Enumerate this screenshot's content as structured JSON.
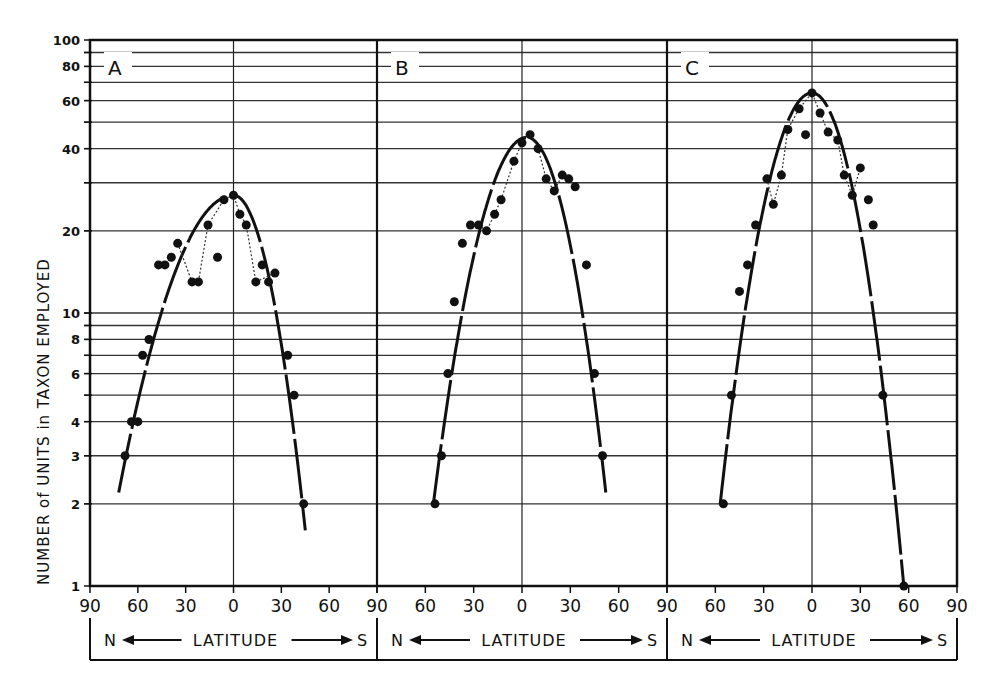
{
  "chart_data": {
    "type": "scatter",
    "ylabel": "NUMBER of UNITS in TAXON EMPLOYED",
    "xlabel": "LATITUDE",
    "xlabel_left": "N",
    "xlabel_right": "S",
    "yscale": "log",
    "ylim": [
      1,
      100
    ],
    "yticks": [
      1,
      2,
      3,
      4,
      6,
      8,
      10,
      20,
      40,
      60,
      80,
      100
    ],
    "ygrid": [
      2,
      3,
      4,
      5,
      6,
      7,
      8,
      9,
      10,
      20,
      30,
      40,
      50,
      60,
      70,
      80,
      90
    ],
    "xticks": [
      "90",
      "60",
      "30",
      "0",
      "30",
      "60",
      "90"
    ],
    "x_note": "Negative x = North latitude, positive x = South latitude",
    "panels": [
      {
        "label": "A",
        "points": [
          {
            "x": -68,
            "y": 3
          },
          {
            "x": -64,
            "y": 4
          },
          {
            "x": -60,
            "y": 4
          },
          {
            "x": -57,
            "y": 7
          },
          {
            "x": -53,
            "y": 8
          },
          {
            "x": -47,
            "y": 15
          },
          {
            "x": -43,
            "y": 15
          },
          {
            "x": -39,
            "y": 16
          },
          {
            "x": -35,
            "y": 18
          },
          {
            "x": -26,
            "y": 13
          },
          {
            "x": -22,
            "y": 13
          },
          {
            "x": -16,
            "y": 21
          },
          {
            "x": -10,
            "y": 16
          },
          {
            "x": -6,
            "y": 26
          },
          {
            "x": 0,
            "y": 27
          },
          {
            "x": 4,
            "y": 23
          },
          {
            "x": 8,
            "y": 21
          },
          {
            "x": 14,
            "y": 13
          },
          {
            "x": 18,
            "y": 15
          },
          {
            "x": 22,
            "y": 13
          },
          {
            "x": 26,
            "y": 14
          },
          {
            "x": 34,
            "y": 7
          },
          {
            "x": 38,
            "y": 5
          },
          {
            "x": 44,
            "y": 2
          }
        ],
        "dotted_path": [
          [
            -35,
            18
          ],
          [
            -26,
            13
          ],
          [
            -22,
            13
          ],
          [
            -16,
            21
          ],
          [
            -6,
            26
          ],
          [
            0,
            27
          ],
          [
            4,
            23
          ],
          [
            8,
            21
          ],
          [
            14,
            13
          ],
          [
            26,
            14
          ]
        ],
        "fit_curve": {
          "peak_x": 0,
          "peak_y": 27,
          "left_end": [
            -72,
            2.2
          ],
          "right_end": [
            45,
            1.6
          ]
        }
      },
      {
        "label": "B",
        "points": [
          {
            "x": -54,
            "y": 2
          },
          {
            "x": -50,
            "y": 3
          },
          {
            "x": -46,
            "y": 6
          },
          {
            "x": -42,
            "y": 11
          },
          {
            "x": -37,
            "y": 18
          },
          {
            "x": -32,
            "y": 21
          },
          {
            "x": -27,
            "y": 21
          },
          {
            "x": -22,
            "y": 20
          },
          {
            "x": -17,
            "y": 23
          },
          {
            "x": -13,
            "y": 26
          },
          {
            "x": -5,
            "y": 36
          },
          {
            "x": 0,
            "y": 42
          },
          {
            "x": 5,
            "y": 45
          },
          {
            "x": 10,
            "y": 40
          },
          {
            "x": 15,
            "y": 31
          },
          {
            "x": 20,
            "y": 28
          },
          {
            "x": 25,
            "y": 32
          },
          {
            "x": 29,
            "y": 31
          },
          {
            "x": 33,
            "y": 29
          },
          {
            "x": 40,
            "y": 15
          },
          {
            "x": 45,
            "y": 6
          },
          {
            "x": 50,
            "y": 3
          }
        ],
        "dotted_path": [
          [
            -32,
            21
          ],
          [
            -27,
            21
          ],
          [
            -22,
            20
          ],
          [
            -17,
            23
          ],
          [
            -13,
            26
          ],
          [
            -5,
            36
          ],
          [
            0,
            42
          ],
          [
            5,
            45
          ],
          [
            10,
            40
          ],
          [
            15,
            31
          ],
          [
            20,
            28
          ],
          [
            25,
            32
          ],
          [
            29,
            31
          ]
        ],
        "fit_curve": {
          "peak_x": 3,
          "peak_y": 44,
          "left_end": [
            -55,
            2
          ],
          "right_end": [
            52,
            2.2
          ]
        }
      },
      {
        "label": "C",
        "points": [
          {
            "x": -55,
            "y": 2
          },
          {
            "x": -50,
            "y": 5
          },
          {
            "x": -45,
            "y": 12
          },
          {
            "x": -40,
            "y": 15
          },
          {
            "x": -35,
            "y": 21
          },
          {
            "x": -28,
            "y": 31
          },
          {
            "x": -24,
            "y": 25
          },
          {
            "x": -19,
            "y": 32
          },
          {
            "x": -15,
            "y": 47
          },
          {
            "x": -8,
            "y": 56
          },
          {
            "x": -4,
            "y": 45
          },
          {
            "x": 0,
            "y": 64
          },
          {
            "x": 5,
            "y": 54
          },
          {
            "x": 10,
            "y": 46
          },
          {
            "x": 16,
            "y": 43
          },
          {
            "x": 20,
            "y": 32
          },
          {
            "x": 25,
            "y": 27
          },
          {
            "x": 30,
            "y": 34
          },
          {
            "x": 35,
            "y": 26
          },
          {
            "x": 38,
            "y": 21
          },
          {
            "x": 44,
            "y": 5
          },
          {
            "x": 57,
            "y": 1
          }
        ],
        "dotted_path": [
          [
            -28,
            31
          ],
          [
            -24,
            25
          ],
          [
            -19,
            32
          ],
          [
            -15,
            47
          ],
          [
            -8,
            56
          ],
          [
            0,
            64
          ],
          [
            5,
            54
          ],
          [
            10,
            46
          ],
          [
            16,
            43
          ],
          [
            20,
            32
          ],
          [
            25,
            27
          ],
          [
            30,
            34
          ]
        ],
        "fit_curve": {
          "peak_x": 0,
          "peak_y": 64,
          "left_end": [
            -57,
            2
          ],
          "right_end": [
            57,
            1
          ]
        }
      }
    ]
  }
}
